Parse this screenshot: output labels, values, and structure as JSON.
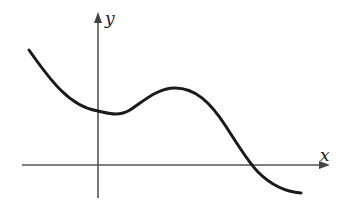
{
  "graph": {
    "x_axis_label": "x",
    "y_axis_label": "y",
    "curve_description": "decreasing curve with local minimum just right of y-axis, local maximum, then crossing x-axis and decreasing",
    "colors": {
      "axes": "#555555",
      "curve": "#1a1a1a",
      "background": "#ffffff"
    }
  }
}
